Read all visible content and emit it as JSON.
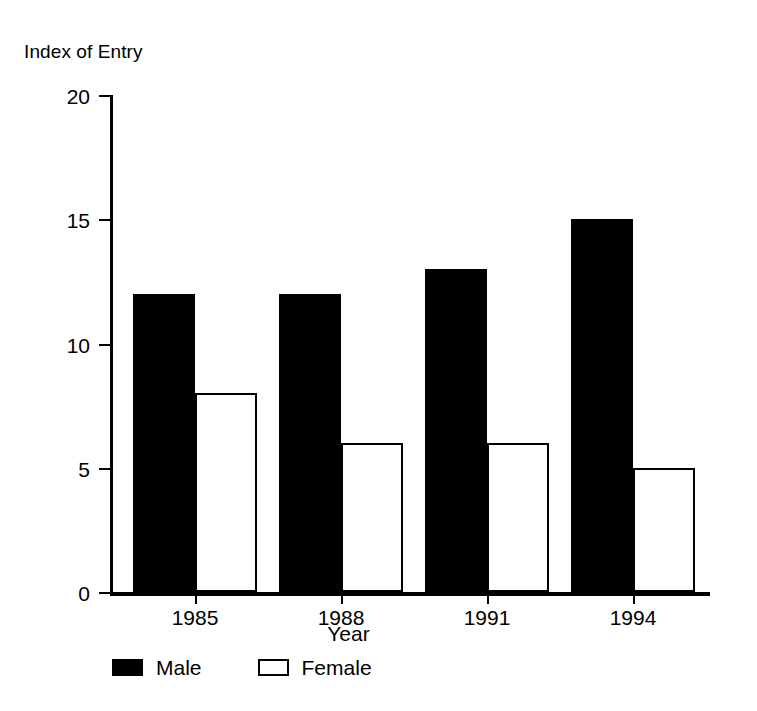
{
  "chart_data": {
    "type": "bar",
    "title": "",
    "xlabel": "Year",
    "ylabel": "Index of Entry",
    "categories": [
      "1985",
      "1988",
      "1991",
      "1994"
    ],
    "series": [
      {
        "name": "Male",
        "values": [
          12,
          12,
          13,
          15
        ],
        "color": "#000000",
        "fill": "solid"
      },
      {
        "name": "Female",
        "values": [
          8,
          6,
          6,
          5
        ],
        "color": "#ffffff",
        "fill": "outline"
      }
    ],
    "ylim": [
      0,
      20
    ],
    "yticks": [
      0,
      5,
      10,
      15,
      20
    ],
    "ytick_labels": [
      "0",
      "5",
      "10",
      "15",
      "20"
    ],
    "grid": false,
    "legend_position": "bottom-left",
    "legend_entries": [
      "Male",
      "Female"
    ]
  },
  "axes": {
    "y_title": "Index of Entry",
    "x_title": "Year"
  },
  "legend": {
    "items": [
      {
        "label": "Male",
        "swatch": "solid-black-square"
      },
      {
        "label": "Female",
        "swatch": "outlined-white-square"
      }
    ]
  }
}
